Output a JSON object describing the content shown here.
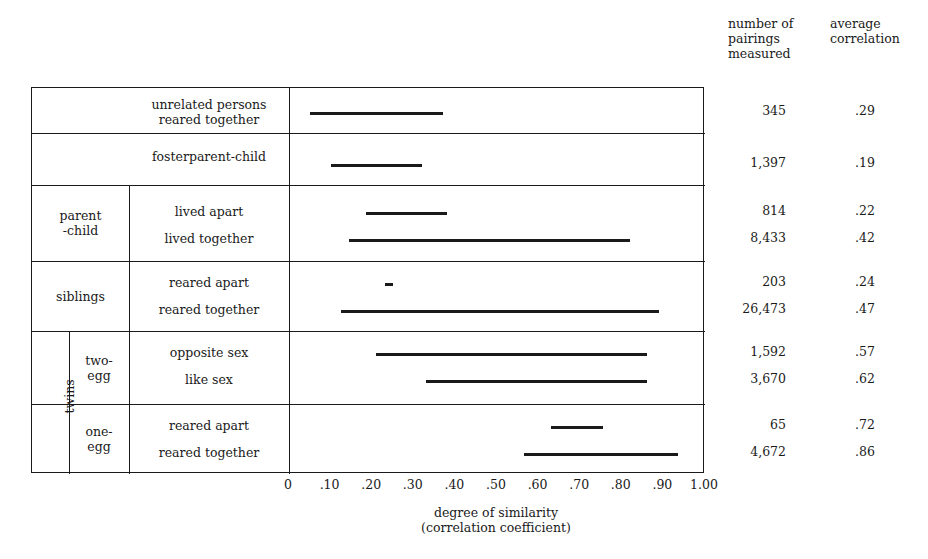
{
  "headers": {
    "pairings": "number of\npairings\nmeasured",
    "correlation": "average\ncorrelation"
  },
  "axis": {
    "caption": "degree of similarity\n(correlation coefficient)",
    "ticks": [
      "0",
      ".10",
      ".20",
      ".30",
      ".40",
      ".50",
      ".60",
      ".70",
      ".80",
      ".90",
      "1.00"
    ],
    "tick_values": [
      0,
      0.1,
      0.2,
      0.3,
      0.4,
      0.5,
      0.6,
      0.7,
      0.8,
      0.9,
      1.0
    ],
    "min": 0,
    "max": 1.0
  },
  "groups": [
    {
      "label": "",
      "sublabel": ""
    },
    {
      "label": "",
      "sublabel": ""
    },
    {
      "label": "parent\n-child",
      "sublabel": ""
    },
    {
      "label": "siblings",
      "sublabel": ""
    },
    {
      "label": "twins",
      "sublabel": "two-\negg"
    },
    {
      "label": "twins",
      "sublabel": "one-\negg"
    }
  ],
  "chart_data": {
    "type": "bar",
    "title": "",
    "xlabel": "degree of similarity (correlation coefficient)",
    "ylabel": "",
    "xlim": [
      0,
      1.0
    ],
    "grid": false,
    "legend": "none",
    "orientation": "horizontal-range",
    "categories": [
      "unrelated persons reared together",
      "fosterparent-child",
      "parent-child lived apart",
      "parent-child lived together",
      "siblings reared apart",
      "siblings reared together",
      "twins two-egg opposite sex",
      "twins two-egg like sex",
      "twins one-egg reared apart",
      "twins one-egg reared together"
    ],
    "rows": [
      {
        "label": "unrelated persons\nreared together",
        "group": "",
        "sub": "",
        "start": 0.05,
        "end": 0.37,
        "pairings": "345",
        "correlation": ".29"
      },
      {
        "label": "fosterparent-child",
        "group": "",
        "sub": "",
        "start": 0.1,
        "end": 0.32,
        "pairings": "1,397",
        "correlation": ".19"
      },
      {
        "label": "lived apart",
        "group": "parent\n-child",
        "sub": "",
        "start": 0.185,
        "end": 0.38,
        "pairings": "814",
        "correlation": ".22"
      },
      {
        "label": "lived together",
        "group": "parent\n-child",
        "sub": "",
        "start": 0.145,
        "end": 0.82,
        "pairings": "8,433",
        "correlation": ".42"
      },
      {
        "label": "reared apart",
        "group": "siblings",
        "sub": "",
        "start": 0.23,
        "end": 0.25,
        "pairings": "203",
        "correlation": ".24"
      },
      {
        "label": "reared together",
        "group": "siblings",
        "sub": "",
        "start": 0.125,
        "end": 0.89,
        "pairings": "26,473",
        "correlation": ".47"
      },
      {
        "label": "opposite sex",
        "group": "twins",
        "sub": "two-\negg",
        "start": 0.21,
        "end": 0.86,
        "pairings": "1,592",
        "correlation": ".57"
      },
      {
        "label": "like sex",
        "group": "twins",
        "sub": "two-\negg",
        "start": 0.33,
        "end": 0.86,
        "pairings": "3,670",
        "correlation": ".62"
      },
      {
        "label": "reared apart",
        "group": "twins",
        "sub": "one-\negg",
        "start": 0.63,
        "end": 0.755,
        "pairings": "65",
        "correlation": ".72"
      },
      {
        "label": "reared together",
        "group": "twins",
        "sub": "one-\negg",
        "start": 0.565,
        "end": 0.935,
        "pairings": "4,672",
        "correlation": ".86"
      }
    ],
    "values": [
      0.29,
      0.19,
      0.22,
      0.42,
      0.24,
      0.47,
      0.57,
      0.62,
      0.72,
      0.86
    ],
    "counts": [
      345,
      1397,
      814,
      8433,
      203,
      26473,
      1592,
      3670,
      65,
      4672
    ]
  },
  "labels": {
    "unrelated": "unrelated persons\nreared together",
    "foster": "fosterparent-child",
    "parent_child": "parent\n-child",
    "lived_apart": "lived apart",
    "lived_together": "lived together",
    "siblings": "siblings",
    "sib_reared_apart": "reared apart",
    "sib_reared_together": "reared together",
    "twins": "twins",
    "two_egg": "two-\negg",
    "opposite_sex": "opposite sex",
    "like_sex": "like sex",
    "one_egg": "one-\negg",
    "one_reared_apart": "reared apart",
    "one_reared_together": "reared together"
  },
  "colors": {
    "ink": "#1a1a1a",
    "bar": "#1a1a1a",
    "background": "#ffffff"
  }
}
